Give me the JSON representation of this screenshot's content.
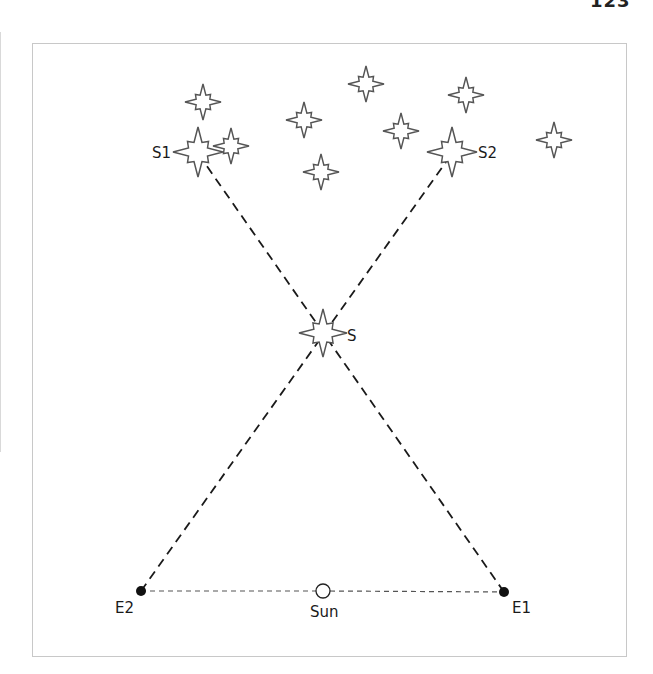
{
  "page": {
    "number": "123"
  },
  "diagram": {
    "labels": {
      "s1": "S1",
      "s2": "S2",
      "s": "S",
      "e1": "E1",
      "e2": "E2",
      "sun": "Sun"
    },
    "colors": {
      "line": "#1a1a1a",
      "star_outline": "#555555",
      "frame": "#c8c8c8",
      "orbit_line": "#555555"
    },
    "stars": [
      {
        "id": "bg1",
        "cx": 203,
        "cy": 102,
        "r": 18
      },
      {
        "id": "bg2",
        "cx": 304,
        "cy": 120,
        "r": 18
      },
      {
        "id": "bg3",
        "cx": 366,
        "cy": 84,
        "r": 18
      },
      {
        "id": "bg4",
        "cx": 401,
        "cy": 131,
        "r": 18
      },
      {
        "id": "bg5",
        "cx": 466,
        "cy": 95,
        "r": 18
      },
      {
        "id": "bg6",
        "cx": 321,
        "cy": 172,
        "r": 18
      },
      {
        "id": "bg7",
        "cx": 231,
        "cy": 146,
        "r": 18
      },
      {
        "id": "bg8",
        "cx": 554,
        "cy": 140,
        "r": 18
      },
      {
        "id": "S1",
        "cx": 198,
        "cy": 152,
        "r": 25
      },
      {
        "id": "S2",
        "cx": 452,
        "cy": 152,
        "r": 25
      },
      {
        "id": "S",
        "cx": 323,
        "cy": 333,
        "r": 24
      }
    ],
    "points": {
      "E1": {
        "x": 504,
        "y": 592
      },
      "E2": {
        "x": 141,
        "y": 591
      },
      "Sun": {
        "x": 323,
        "y": 591
      }
    }
  }
}
